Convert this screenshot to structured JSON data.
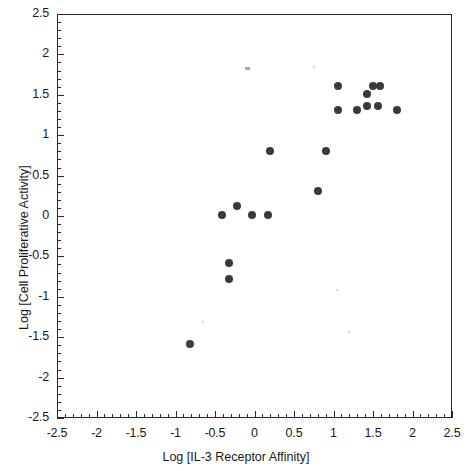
{
  "chart_data": {
    "type": "scatter",
    "title": "",
    "xlabel": "Log [IL-3 Receptor Affinity]",
    "ylabel": "Log [Cell Proliferative Activity]",
    "xlim": [
      -2.5,
      2.5
    ],
    "ylim": [
      -2.5,
      2.5
    ],
    "xticks": [
      -2.5,
      -2,
      -1.5,
      -1,
      -0.5,
      0,
      0.5,
      1,
      1.5,
      2,
      2.5
    ],
    "yticks": [
      -2.5,
      -2,
      -1.5,
      -1,
      -0.5,
      0,
      0.5,
      1,
      1.5,
      2,
      2.5
    ],
    "xticklabels": [
      "-2.5",
      "-2",
      "-1.5",
      "-1",
      "-0.5",
      "0",
      "0.5",
      "1",
      "1.5",
      "2",
      "2.5"
    ],
    "yticklabels": [
      "-2.5",
      "-2",
      "-1.5",
      "-1",
      "-0.5",
      "0",
      "0.5",
      "1",
      "1.5",
      "2",
      "2.5"
    ],
    "minor_tick_interval": 0.1,
    "grid": false,
    "legend": false,
    "marker": "filled-circle",
    "marker_color": "#3a3a3a",
    "marker_size": 8,
    "points": [
      {
        "x": -0.82,
        "y": -1.58
      },
      {
        "x": -0.32,
        "y": -0.58
      },
      {
        "x": -0.32,
        "y": -0.78
      },
      {
        "x": -0.41,
        "y": 0.01
      },
      {
        "x": -0.22,
        "y": 0.12
      },
      {
        "x": -0.03,
        "y": 0.01
      },
      {
        "x": 0.17,
        "y": 0.01
      },
      {
        "x": 0.19,
        "y": 0.81
      },
      {
        "x": 0.9,
        "y": 0.81
      },
      {
        "x": 0.81,
        "y": 0.31
      },
      {
        "x": 1.06,
        "y": 1.61
      },
      {
        "x": 1.06,
        "y": 1.31
      },
      {
        "x": 1.3,
        "y": 1.31
      },
      {
        "x": 1.43,
        "y": 1.51
      },
      {
        "x": 1.5,
        "y": 1.61
      },
      {
        "x": 1.59,
        "y": 1.61
      },
      {
        "x": 1.43,
        "y": 1.36
      },
      {
        "x": 1.56,
        "y": 1.36
      },
      {
        "x": 1.8,
        "y": 1.31
      }
    ],
    "artifacts": [
      {
        "type": "smudge",
        "x": -0.09,
        "y": 1.83
      },
      {
        "type": "speck",
        "x": -0.66,
        "y": -1.3
      },
      {
        "type": "speck",
        "x": 0.74,
        "y": 1.86
      },
      {
        "type": "speck",
        "x": 1.03,
        "y": -0.9
      },
      {
        "type": "speck",
        "x": 1.18,
        "y": -1.42
      }
    ]
  },
  "colors": {
    "background": "#ffffff",
    "axis": "#2a2a2a",
    "marker": "#3a3a3a",
    "text": "#1a1a1a"
  }
}
